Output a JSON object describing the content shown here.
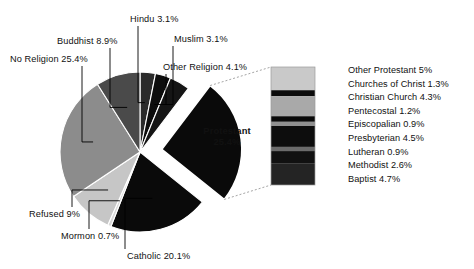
{
  "chart_data": {
    "type": "pie",
    "title": "",
    "subtitle": "",
    "xlabel": "",
    "ylabel": "",
    "legend_position": "right",
    "grid": false,
    "categories": [
      "Hindu",
      "Muslim",
      "Other Religion",
      "Protestant",
      "Catholic",
      "Mormon",
      "Refused",
      "No Religion",
      "Buddhist"
    ],
    "values": [
      3.1,
      3.1,
      4.1,
      25.4,
      20.1,
      0.7,
      9.0,
      25.4,
      8.9
    ],
    "units": "percent",
    "exploded_slice": "Protestant",
    "slices": [
      {
        "label": "Hindu 3.1%",
        "name": "Hindu",
        "value": 3.1,
        "color": "#2b2b2b"
      },
      {
        "label": "Muslim 3.1%",
        "name": "Muslim",
        "value": 3.1,
        "color": "#0d0d0d"
      },
      {
        "label": "Other Religion 4.1%",
        "name": "Other Religion",
        "value": 4.1,
        "color": "#151515"
      },
      {
        "label": "Protestant",
        "name": "Protestant",
        "value": 25.4,
        "color": "#0a0a0a"
      },
      {
        "label": "Catholic 20.1%",
        "name": "Catholic",
        "value": 20.1,
        "color": "#0a0a0a"
      },
      {
        "label": "Mormon 0.7%",
        "name": "Mormon",
        "value": 0.7,
        "color": "#d8d8d8"
      },
      {
        "label": "Refused 9%",
        "name": "Refused",
        "value": 9.0,
        "color": "#c6c6c6"
      },
      {
        "label": "No Religion 25.4%",
        "name": "No Religion",
        "value": 25.4,
        "color": "#8c8c8c"
      },
      {
        "label": "Buddhist 8.9%",
        "name": "Buddhist",
        "value": 8.9,
        "color": "#4a4a4a"
      }
    ],
    "center_label": {
      "line1": "Protestant",
      "line2": "25.4%"
    },
    "breakdown": {
      "of": "Protestant",
      "type": "stacked_bar",
      "total": 25.4,
      "segments": [
        {
          "label": "Other Protestant 5%",
          "name": "Other Protestant",
          "value": 5.0,
          "color": "#c9c9c9"
        },
        {
          "label": "Churches of Christ 1.3%",
          "name": "Churches of Christ",
          "value": 1.3,
          "color": "#0c0c0c"
        },
        {
          "label": "Christian Church 4.3%",
          "name": "Christian Church",
          "value": 4.3,
          "color": "#a9a9a9"
        },
        {
          "label": "Pentecostal 1.2%",
          "name": "Pentecostal",
          "value": 1.2,
          "color": "#0a0a0a"
        },
        {
          "label": "Episcopalian 0.9%",
          "name": "Episcopalian",
          "value": 0.9,
          "color": "#8f8f8f"
        },
        {
          "label": "Presbyterian 4.5%",
          "name": "Presbyterian",
          "value": 4.5,
          "color": "#0d0d0d"
        },
        {
          "label": "Lutheran 0.9%",
          "name": "Lutheran",
          "value": 0.9,
          "color": "#6b6b6b"
        },
        {
          "label": "Methodist 2.6%",
          "name": "Methodist",
          "value": 2.6,
          "color": "#111111"
        },
        {
          "label": "Baptist 4.7%",
          "name": "Baptist",
          "value": 4.7,
          "color": "#242424"
        }
      ]
    }
  },
  "labels": {
    "hindu": "Hindu 3.1%",
    "muslim": "Muslim 3.1%",
    "buddhist": "Buddhist 8.9%",
    "no_religion": "No Religion 25.4%",
    "other_religion": "Other Religion 4.1%",
    "refused": "Refused 9%",
    "mormon": "Mormon 0.7%",
    "catholic": "Catholic 20.1%",
    "protestant_line1": "Protestant",
    "protestant_line2": "25.4%"
  },
  "legend": {
    "items": [
      "Other Protestant 5%",
      "Churches of Christ 1.3%",
      "Christian Church 4.3%",
      "Pentecostal 1.2%",
      "Episcopalian 0.9%",
      "Presbyterian 4.5%",
      "Lutheran 0.9%",
      "Methodist 2.6%",
      "Baptist 4.7%"
    ]
  }
}
